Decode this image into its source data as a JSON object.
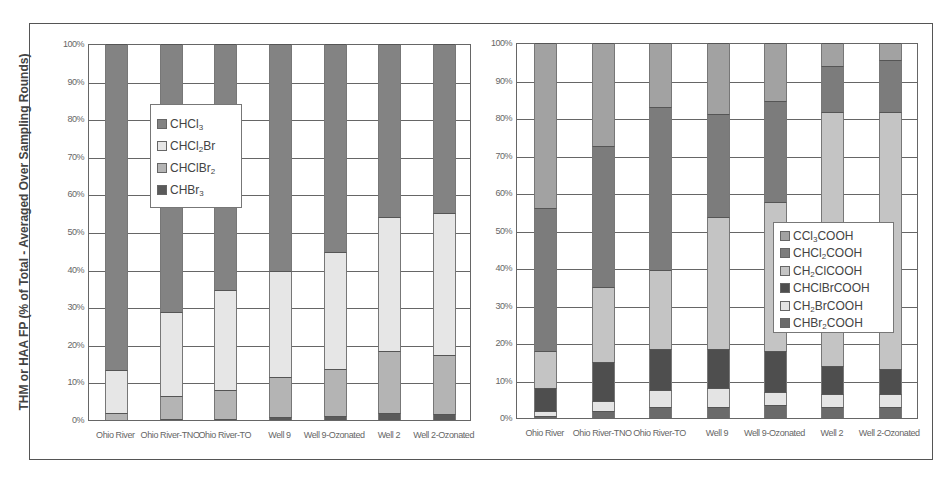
{
  "chart_data": [
    {
      "type": "bar",
      "stacked": true,
      "percent": true,
      "title": "",
      "xlabel": "",
      "ylabel": "THM or HAA FP (% of Total - Averaged Over Sampling Rounds)",
      "ylim": [
        0,
        100
      ],
      "yticks": [
        "0%",
        "10%",
        "20%",
        "30%",
        "40%",
        "50%",
        "60%",
        "70%",
        "80%",
        "90%",
        "100%"
      ],
      "grid": true,
      "legend_position": "upper-left-inside",
      "categories": [
        "Ohio River",
        "Ohio River-TNO",
        "Ohio River-TO",
        "Well 9",
        "Well 9-Ozonated",
        "Well 2",
        "Well 2-Ozonated"
      ],
      "series": [
        {
          "name": "CHBr3",
          "label_html": "CHBr<sub>3</sub>",
          "color": "#5a5a5a",
          "values": [
            0.0,
            0.3,
            0.4,
            0.9,
            1.0,
            1.8,
            1.7
          ]
        },
        {
          "name": "CHClBr2",
          "label_html": "CHClBr<sub>2</sub>",
          "color": "#b4b4b4",
          "values": [
            1.8,
            6.0,
            7.6,
            10.5,
            12.6,
            16.5,
            15.5
          ]
        },
        {
          "name": "CHCl2Br",
          "label_html": "CHCl<sub>2</sub>Br",
          "color": "#e6e6e6",
          "values": [
            11.5,
            22.5,
            26.5,
            28.3,
            31.0,
            35.7,
            37.8
          ]
        },
        {
          "name": "CHCl3",
          "label_html": "CHCl<sub>3</sub>",
          "color": "#838383",
          "values": [
            86.7,
            71.2,
            65.5,
            60.3,
            55.4,
            46.0,
            45.0
          ]
        }
      ],
      "legend_order": [
        "CHCl3",
        "CHCl2Br",
        "CHClBr2",
        "CHBr3"
      ]
    },
    {
      "type": "bar",
      "stacked": true,
      "percent": true,
      "title": "",
      "xlabel": "",
      "ylabel": "",
      "ylim": [
        0,
        100
      ],
      "yticks": [
        "0%",
        "10%",
        "20%",
        "30%",
        "40%",
        "50%",
        "60%",
        "70%",
        "80%",
        "90%",
        "100%"
      ],
      "grid": true,
      "legend_position": "lower-right-inside",
      "categories": [
        "Ohio River",
        "Ohio River-TNO",
        "Ohio River-TO",
        "Well 9",
        "Well 9-Ozonated",
        "Well 2",
        "Well 2-Ozonated"
      ],
      "series": [
        {
          "name": "CHBr2COOH",
          "label_html": "CHBr<sub>2</sub>COOH",
          "color": "#6a6a6a",
          "values": [
            0.5,
            2.0,
            3.0,
            3.0,
            3.5,
            3.0,
            3.0
          ]
        },
        {
          "name": "CH2BrCOOH",
          "label_html": "CH<sub>2</sub>BrCOOH",
          "color": "#e4e4e4",
          "values": [
            1.5,
            2.5,
            4.5,
            5.0,
            3.5,
            3.5,
            3.5
          ]
        },
        {
          "name": "CHClBrCOOH",
          "label_html": "CHClBrCOOH",
          "color": "#4e4e4e",
          "values": [
            6.0,
            10.5,
            11.0,
            10.5,
            11.0,
            7.5,
            6.5
          ]
        },
        {
          "name": "CH2ClCOOH",
          "label_html": "CH<sub>2</sub>ClCOOH",
          "color": "#c4c4c4",
          "values": [
            10.0,
            20.0,
            21.0,
            35.0,
            39.5,
            67.5,
            68.5
          ]
        },
        {
          "name": "CHCl2COOH",
          "label_html": "CHCl<sub>2</sub>COOH",
          "color": "#7c7c7c",
          "values": [
            38.0,
            37.5,
            43.5,
            27.5,
            27.0,
            12.5,
            14.0
          ]
        },
        {
          "name": "CCl3COOH",
          "label_html": "CCl<sub>3</sub>COOH",
          "color": "#a2a2a2",
          "values": [
            44.0,
            27.5,
            17.0,
            19.0,
            15.5,
            6.0,
            4.5
          ]
        }
      ],
      "legend_order": [
        "CCl3COOH",
        "CHCl2COOH",
        "CH2ClCOOH",
        "CHClBrCOOH",
        "CH2BrCOOH",
        "CHBr2COOH"
      ]
    }
  ]
}
